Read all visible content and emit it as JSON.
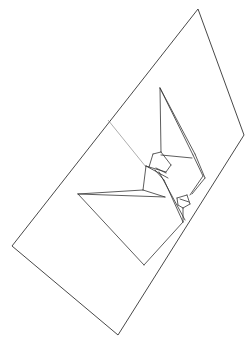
{
  "diagram": {
    "stroke_color": "#333333",
    "thin_stroke_color": "#777777",
    "background": "#ffffff",
    "sheet_outline": [
      [
        198,
        9
      ],
      [
        244,
        135
      ],
      [
        118,
        335
      ],
      [
        12,
        246
      ]
    ],
    "fold_line": [
      [
        108,
        120
      ],
      [
        146,
        167
      ]
    ],
    "crane_segments": [
      [
        [
          160,
          88
        ],
        [
          161,
          152
        ]
      ],
      [
        [
          160,
          88
        ],
        [
          193,
          155
        ]
      ],
      [
        [
          160,
          88
        ],
        [
          195,
          154
        ]
      ],
      [
        [
          193,
          155
        ],
        [
          203,
          176
        ]
      ],
      [
        [
          195,
          154
        ],
        [
          205,
          178
        ]
      ],
      [
        [
          161,
          155
        ],
        [
          192,
          158
        ]
      ],
      [
        [
          153,
          154
        ],
        [
          161,
          152
        ]
      ],
      [
        [
          153,
          154
        ],
        [
          149,
          167
        ]
      ],
      [
        [
          161,
          152
        ],
        [
          171,
          165
        ]
      ],
      [
        [
          171,
          165
        ],
        [
          166,
          172
        ]
      ],
      [
        [
          149,
          167
        ],
        [
          166,
          172
        ]
      ],
      [
        [
          149,
          167
        ],
        [
          146,
          166
        ]
      ],
      [
        [
          146,
          166
        ],
        [
          143,
          190
        ]
      ],
      [
        [
          146,
          166
        ],
        [
          168,
          178
        ]
      ],
      [
        [
          156,
          168
        ],
        [
          166,
          173
        ]
      ],
      [
        [
          155,
          170
        ],
        [
          164,
          180
        ]
      ],
      [
        [
          164,
          180
        ],
        [
          183,
          222
        ]
      ],
      [
        [
          159,
          172
        ],
        [
          185,
          220
        ]
      ],
      [
        [
          78,
          194
        ],
        [
          143,
          190
        ]
      ],
      [
        [
          78,
          194
        ],
        [
          165,
          197
        ]
      ],
      [
        [
          143,
          190
        ],
        [
          165,
          197
        ]
      ],
      [
        [
          78,
          194
        ],
        [
          144,
          265
        ]
      ],
      [
        [
          144,
          265
        ],
        [
          183,
          222
        ]
      ],
      [
        [
          177,
          198
        ],
        [
          187,
          195
        ]
      ],
      [
        [
          177,
          198
        ],
        [
          178,
          205
        ]
      ],
      [
        [
          187,
          195
        ],
        [
          190,
          204
        ]
      ],
      [
        [
          178,
          205
        ],
        [
          183,
          208
        ]
      ],
      [
        [
          183,
          208
        ],
        [
          190,
          204
        ]
      ],
      [
        [
          180,
          199
        ],
        [
          189,
          202
        ]
      ],
      [
        [
          183,
          208
        ],
        [
          183,
          222
        ]
      ],
      [
        [
          203,
          176
        ],
        [
          190,
          195
        ]
      ],
      [
        [
          205,
          178
        ],
        [
          192,
          194
        ]
      ]
    ]
  }
}
